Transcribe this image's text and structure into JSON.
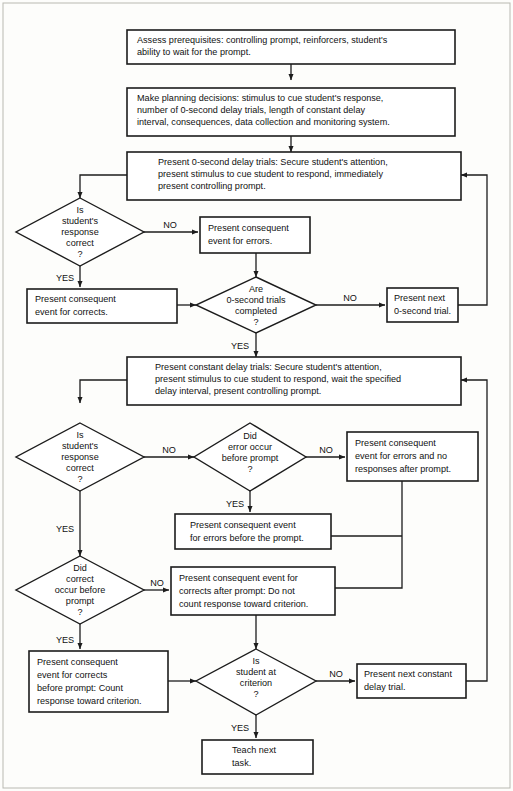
{
  "diagram": {
    "colors": {
      "background": "#fdfdfb",
      "stroke": "#1c1c1c",
      "box_fill": "#ffffff",
      "frame": "#b9b9b2"
    },
    "labels": {
      "yes": "YES",
      "no": "NO"
    },
    "nodes": [
      {
        "id": "assess-prerequisites",
        "shape": "process",
        "lines": [
          "Assess prerequisites: controlling prompt, reinforcers, student's",
          "ability to wait for the prompt."
        ]
      },
      {
        "id": "planning-decisions",
        "shape": "process",
        "lines": [
          "Make planning decisions: stimulus to cue student's response,",
          "number of 0-second delay trials, length of constant delay",
          "interval, consequences, data collection and monitoring system."
        ]
      },
      {
        "id": "present-zero-second-delay-trials",
        "shape": "process",
        "lines": [
          "Present 0-second delay trials: Secure student's attention,",
          "present stimulus to cue student to respond, immediately",
          "present controlling prompt."
        ]
      },
      {
        "id": "is-response-correct-zero",
        "shape": "decision",
        "lines": [
          "Is",
          "student's",
          "response",
          "correct",
          "?"
        ]
      },
      {
        "id": "consequent-errors-zero",
        "shape": "process",
        "lines": [
          "Present consequent",
          "event for errors."
        ]
      },
      {
        "id": "consequent-corrects-zero",
        "shape": "process",
        "lines": [
          "Present consequent",
          "event for corrects."
        ]
      },
      {
        "id": "are-zero-second-trials-completed",
        "shape": "decision",
        "lines": [
          "Are",
          "0-second trials",
          "completed",
          "?"
        ]
      },
      {
        "id": "present-next-zero-second-trial",
        "shape": "process",
        "lines": [
          "Present next",
          "0-second trial."
        ]
      },
      {
        "id": "present-constant-delay-trials",
        "shape": "process",
        "lines": [
          "Present constant delay trials: Secure student's attention,",
          "present stimulus to cue student to respond, wait the specified",
          "delay interval, present controlling prompt."
        ]
      },
      {
        "id": "is-response-correct-constant",
        "shape": "decision",
        "lines": [
          "Is",
          "student's",
          "response",
          "correct",
          "?"
        ]
      },
      {
        "id": "did-error-occur-before-prompt",
        "shape": "decision",
        "lines": [
          "Did",
          "error occur",
          "before prompt",
          "?"
        ]
      },
      {
        "id": "consequent-errors-no-responses-after-prompt",
        "shape": "process",
        "lines": [
          "Present consequent",
          "event for errors and no",
          "responses after prompt."
        ]
      },
      {
        "id": "consequent-errors-before-prompt",
        "shape": "process",
        "lines": [
          "Present consequent event",
          "for errors before the prompt."
        ]
      },
      {
        "id": "did-correct-occur-before-prompt",
        "shape": "decision",
        "lines": [
          "Did",
          "correct",
          "occur before",
          "prompt",
          "?"
        ]
      },
      {
        "id": "consequent-corrects-after-prompt",
        "shape": "process",
        "lines": [
          "Present consequent event for",
          "corrects after prompt: Do not",
          "count response toward criterion."
        ]
      },
      {
        "id": "consequent-corrects-before-prompt",
        "shape": "process",
        "lines": [
          "Present consequent",
          "event for corrects",
          "before prompt: Count",
          "response toward criterion."
        ]
      },
      {
        "id": "is-student-at-criterion",
        "shape": "decision",
        "lines": [
          "Is",
          "student at",
          "criterion",
          "?"
        ]
      },
      {
        "id": "present-next-constant-delay-trial",
        "shape": "process",
        "lines": [
          "Present next constant",
          "delay trial."
        ]
      },
      {
        "id": "teach-next-task",
        "shape": "process",
        "lines": [
          "Teach next",
          "task."
        ]
      }
    ],
    "edge_labels": [
      {
        "id": "no-response-correct-zero",
        "text": "NO"
      },
      {
        "id": "yes-response-correct-zero",
        "text": "YES"
      },
      {
        "id": "no-zero-trials-completed",
        "text": "NO"
      },
      {
        "id": "yes-zero-trials-completed",
        "text": "YES"
      },
      {
        "id": "no-response-correct-constant",
        "text": "NO"
      },
      {
        "id": "yes-response-correct-constant",
        "text": "YES"
      },
      {
        "id": "no-error-before-prompt",
        "text": "NO"
      },
      {
        "id": "yes-error-before-prompt",
        "text": "YES"
      },
      {
        "id": "no-correct-before-prompt",
        "text": "NO"
      },
      {
        "id": "yes-correct-before-prompt",
        "text": "YES"
      },
      {
        "id": "no-student-at-criterion",
        "text": "NO"
      },
      {
        "id": "yes-student-at-criterion",
        "text": "YES"
      }
    ]
  }
}
